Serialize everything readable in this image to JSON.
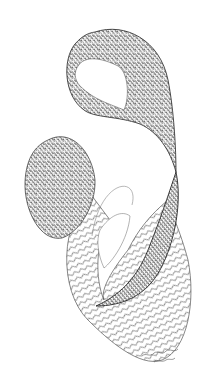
{
  "artwork": {
    "type": "pen-and-ink drawing",
    "background": "#ffffff",
    "ink": "#1a1a1a",
    "shapes": [
      {
        "name": "hook-loop",
        "pattern": "dense crosshatch with triangular zentangle motifs"
      },
      {
        "name": "left-oval",
        "pattern": "crosshatch with triangular motifs"
      },
      {
        "name": "wave-ribbon-lower",
        "pattern": "wavy parallel lines"
      },
      {
        "name": "dark-band",
        "pattern": "dense stippled crosshatch"
      },
      {
        "name": "thin-arc",
        "pattern": "single outline"
      }
    ],
    "signature": "illegible handwritten signature"
  }
}
